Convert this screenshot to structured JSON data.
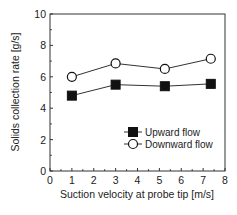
{
  "chart_data": {
    "type": "line",
    "title": "",
    "xlabel": "Suction velocity at probe tip [m/s]",
    "ylabel": "Solids collection rate [g/s]",
    "xlim": [
      0,
      8
    ],
    "ylim": [
      0,
      10
    ],
    "xticks": [
      0,
      1,
      2,
      3,
      4,
      5,
      6,
      7,
      8
    ],
    "yticks": [
      0,
      2,
      4,
      6,
      8,
      10
    ],
    "grid": false,
    "legend_position": "lower right (inside)",
    "series": [
      {
        "name": "Upward flow",
        "marker": "filled-square",
        "color": "#111111",
        "x": [
          1.0,
          3.0,
          5.25,
          7.35
        ],
        "y": [
          4.8,
          5.5,
          5.4,
          5.55
        ]
      },
      {
        "name": "Downward flow",
        "marker": "open-circle",
        "color": "#111111",
        "x": [
          1.0,
          3.0,
          5.25,
          7.35
        ],
        "y": [
          6.0,
          6.85,
          6.5,
          7.15
        ]
      }
    ]
  },
  "labels": {
    "xlabel": "Suction velocity at probe tip [m/s]",
    "ylabel": "Solids collection rate [g/s]",
    "legend": [
      "Upward flow",
      "Downward flow"
    ]
  }
}
